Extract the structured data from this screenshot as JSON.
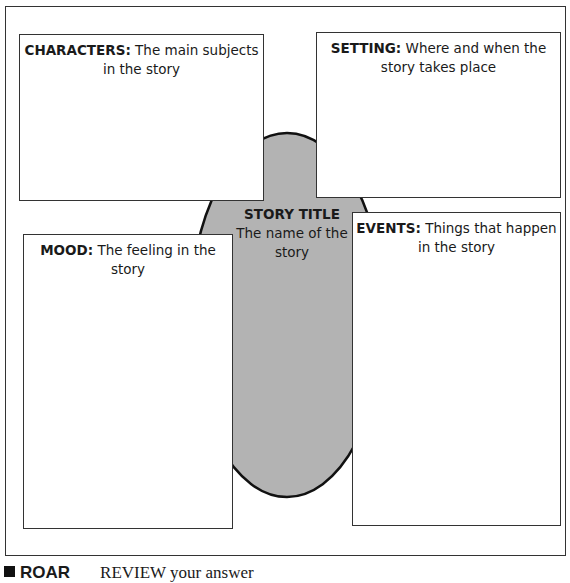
{
  "organizer": {
    "characters": {
      "label": "CHARACTERS:",
      "text": " The main subjects in the story"
    },
    "setting": {
      "label": "SETTING:",
      "text": " Where and when the story takes place"
    },
    "mood": {
      "label": "MOOD:",
      "text": " The feeling in the story"
    },
    "events": {
      "label": "EVENTS:",
      "text": " Things that happen in the story"
    },
    "center": {
      "label": "STORY TITLE",
      "text": "The name of the story"
    },
    "center_fill": "#b3b3b3"
  },
  "footer": {
    "tag": "ROAR",
    "text": "REVIEW your answer"
  }
}
